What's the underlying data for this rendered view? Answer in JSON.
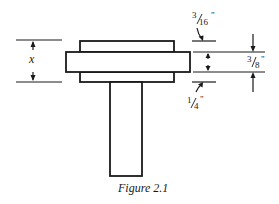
{
  "figure": {
    "caption": "Figure 2.1",
    "labels": {
      "x": "x",
      "top_gap": {
        "num": "3",
        "den": "16",
        "unit": "\""
      },
      "plate_thickness": {
        "num": "3",
        "den": "8",
        "unit": "\""
      },
      "bottom_gap": {
        "num": "1",
        "den": "4",
        "unit": "\""
      }
    },
    "colors": {
      "stroke": "#1a1a1a",
      "background": "#ffffff"
    }
  }
}
